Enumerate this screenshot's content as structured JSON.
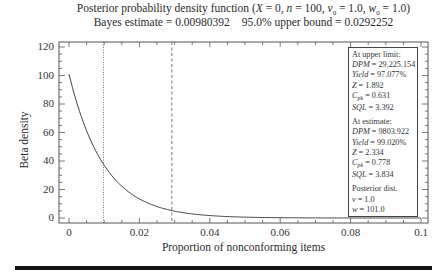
{
  "header": {
    "title_line1_prefix": "Posterior probability density function (",
    "title_params": "X = 0, n = 100, v0 = 1.0, w0 = 1.0",
    "title_line1": "Posterior probability density function (X = 0, n = 100, v₀ = 1.0, w₀ = 1.0)",
    "bayes_estimate_label": "Bayes estimate = 0.00980392",
    "upper_bound_label": "95.0% upper bound = 0.0292252"
  },
  "axes": {
    "ylabel": "Beta density",
    "xlabel": "Proportion of nonconforming items",
    "yticks": [
      "0",
      "20",
      "40",
      "60",
      "80",
      "100",
      "120"
    ],
    "xticks": [
      "0",
      "0.02",
      "0.04",
      "0.06",
      "0.08",
      "0.1"
    ]
  },
  "legend": {
    "upper": {
      "heading": "At upper limit:",
      "dpm_label": "DPM",
      "dpm_value": " = 29,225.154",
      "yield_label": "Yield",
      "yield_value": " = 97.077%",
      "z_label": "Z",
      "z_value": " = 1.892",
      "cpk_label": "C",
      "cpk_sub": "pk",
      "cpk_value": " = 0.631",
      "sql_label": "SQL",
      "sql_value": " = 3.392"
    },
    "estimate": {
      "heading": "At estimate:",
      "dpm_label": "DPM",
      "dpm_value": " = 9803.922",
      "yield_label": "Yield",
      "yield_value": " = 99.020%",
      "z_label": "Z",
      "z_value": " = 2.334",
      "cpk_label": "C",
      "cpk_sub": "pk",
      "cpk_value": " = 0.778",
      "sql_label": "SQL",
      "sql_value": " = 3.834"
    },
    "posterior": {
      "heading": "Posterior dist.",
      "v_label": "v",
      "v_value": " = 1.0",
      "w_label": "w",
      "w_value": " = 101.0"
    }
  },
  "chart_data": {
    "type": "line",
    "title": "Posterior probability density function (X = 0, n = 100, v0 = 1.0, w0 = 1.0)",
    "subtitle": "Bayes estimate = 0.00980392    95.0% upper bound = 0.0292252",
    "xlabel": "Proportion of nonconforming items",
    "ylabel": "Beta density",
    "xlim": [
      0,
      0.1
    ],
    "ylim": [
      0,
      120
    ],
    "grid": false,
    "legend_position": "upper right (text box)",
    "series": [
      {
        "name": "Beta(1, 101) posterior density",
        "x": [
          0,
          0.005,
          0.01,
          0.015,
          0.02,
          0.025,
          0.03,
          0.035,
          0.04,
          0.05,
          0.06,
          0.07,
          0.08,
          0.09,
          0.1
        ],
        "values": [
          101.0,
          61.1,
          36.9,
          22.2,
          13.4,
          8.0,
          4.8,
          2.9,
          1.7,
          0.6,
          0.2,
          0.07,
          0.02,
          0.008,
          0.003
        ]
      }
    ],
    "vertical_lines": [
      {
        "name": "Bayes estimate",
        "x": 0.00980392,
        "style": "dotted"
      },
      {
        "name": "95.0% upper bound",
        "x": 0.0292252,
        "style": "dashed"
      }
    ],
    "annotations": [
      "At upper limit: DPM = 29,225.154, Yield = 97.077%, Z = 1.892, Cpk = 0.631, SQL = 3.392",
      "At estimate: DPM = 9803.922, Yield = 99.020%, Z = 2.334, Cpk = 0.778, SQL = 3.834",
      "Posterior dist. v = 1.0, w = 101.0"
    ]
  }
}
